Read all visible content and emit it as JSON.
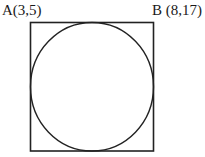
{
  "diagram": {
    "type": "circle inscribed in square",
    "labels": {
      "a": "A(3,5)",
      "b": "B (8,17)"
    },
    "square": {
      "x": 30.5,
      "y": 22.5,
      "width": 123,
      "height": 128.5,
      "stroke": "#222222"
    },
    "circle": {
      "cx": 92,
      "cy": 86.75,
      "rx": 61.5,
      "ry": 64.25,
      "stroke": "#222222"
    }
  }
}
